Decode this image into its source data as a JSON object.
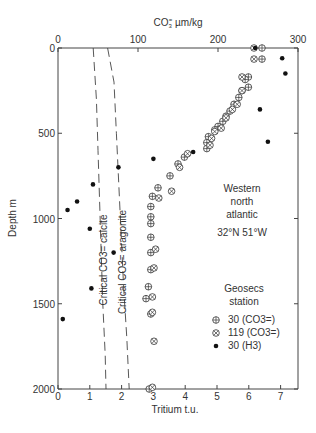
{
  "chart_data": {
    "type": "scatter",
    "title": "",
    "top_axis": {
      "label": "CO3= µm/kg",
      "label_main": "CO",
      "label_sub": "3",
      "label_sup": "=",
      "label_unit": " µm/kg",
      "range": [
        0,
        300
      ],
      "ticks": [
        0,
        100,
        200,
        300
      ]
    },
    "bottom_axis": {
      "label": "Tritium t.u.",
      "range": [
        0,
        7.5
      ],
      "ticks": [
        0,
        1,
        2,
        3,
        4,
        5,
        6,
        7
      ]
    },
    "y_axis": {
      "label": "Depth m",
      "range": [
        0,
        2000
      ],
      "inverted": true,
      "ticks": [
        0,
        500,
        1000,
        1500,
        2000
      ]
    },
    "grid": false,
    "annotations": {
      "region": [
        "Western",
        "north",
        "atlantic"
      ],
      "coords": "32°N  51°W",
      "legend_title": [
        "Geosecs",
        "station"
      ],
      "calcite_label": "Critical CO3= calcite",
      "aragonite_label": "Critical CO3= aragonite"
    },
    "legend": [
      {
        "symbol": "circle-plus",
        "label": "30 (CO3=)"
      },
      {
        "symbol": "circle-x",
        "label": "119 (CO3=)"
      },
      {
        "symbol": "dot",
        "label": "30 (H3)"
      }
    ],
    "series": [
      {
        "name": "30 (CO3=)",
        "axis": "top",
        "symbol": "circle-plus",
        "points": [
          [
            255,
            0
          ],
          [
            255,
            65
          ],
          [
            238,
            170
          ],
          [
            234,
            185
          ],
          [
            238,
            230
          ],
          [
            230,
            250
          ],
          [
            226,
            290
          ],
          [
            220,
            330
          ],
          [
            215,
            370
          ],
          [
            210,
            400
          ],
          [
            206,
            430
          ],
          [
            200,
            460
          ],
          [
            196,
            480
          ],
          [
            188,
            520
          ],
          [
            186,
            555
          ],
          [
            186,
            590
          ],
          [
            158,
            640
          ],
          [
            150,
            680
          ],
          [
            140,
            750
          ],
          [
            125,
            820
          ],
          [
            118,
            870
          ],
          [
            116,
            930
          ],
          [
            116,
            990
          ],
          [
            116,
            1030
          ],
          [
            116,
            1110
          ],
          [
            116,
            1200
          ],
          [
            116,
            1300
          ],
          [
            113,
            1400
          ],
          [
            110,
            1470
          ],
          [
            116,
            1560
          ],
          [
            114,
            2000
          ]
        ]
      },
      {
        "name": "119 (CO3=)",
        "axis": "top",
        "symbol": "circle-x",
        "points": [
          [
            245,
            0
          ],
          [
            245,
            65
          ],
          [
            230,
            170
          ],
          [
            230,
            250
          ],
          [
            224,
            330
          ],
          [
            218,
            360
          ],
          [
            210,
            410
          ],
          [
            204,
            470
          ],
          [
            196,
            490
          ],
          [
            192,
            530
          ],
          [
            190,
            570
          ],
          [
            162,
            620
          ],
          [
            152,
            700
          ],
          [
            142,
            840
          ],
          [
            126,
            880
          ],
          [
            122,
            1180
          ],
          [
            120,
            1290
          ],
          [
            118,
            1460
          ],
          [
            118,
            1550
          ],
          [
            120,
            1720
          ],
          [
            118,
            1990
          ]
        ]
      },
      {
        "name": "30 (H3)",
        "axis": "bottom",
        "symbol": "dot",
        "points": [
          [
            6.2,
            0
          ],
          [
            7.05,
            60
          ],
          [
            7.15,
            150
          ],
          [
            6.35,
            360
          ],
          [
            6.6,
            550
          ],
          [
            4.25,
            610
          ],
          [
            3.0,
            650
          ],
          [
            1.9,
            700
          ],
          [
            1.1,
            800
          ],
          [
            0.6,
            900
          ],
          [
            0.3,
            950
          ],
          [
            1.0,
            1060
          ],
          [
            1.75,
            1200
          ],
          [
            1.05,
            1410
          ],
          [
            0.15,
            1590
          ]
        ]
      }
    ],
    "curves": [
      {
        "name": "Critical CO3= calcite",
        "style": "dashed",
        "axis": "top",
        "points": [
          [
            44,
            0
          ],
          [
            48,
            300
          ],
          [
            50,
            600
          ],
          [
            52,
            900
          ],
          [
            54,
            1200
          ],
          [
            56,
            1500
          ],
          [
            59,
            1800
          ],
          [
            60,
            2000
          ]
        ]
      },
      {
        "name": "Critical CO3= aragonite",
        "style": "dashed",
        "axis": "top",
        "points": [
          [
            62,
            0
          ],
          [
            70,
            200
          ],
          [
            73,
            500
          ],
          [
            76,
            800
          ],
          [
            79,
            1100
          ],
          [
            82,
            1400
          ],
          [
            86,
            1700
          ],
          [
            89,
            2000
          ]
        ]
      }
    ]
  },
  "caption": "Figure: CO3= and tritium versus depth, Western north Atlantic"
}
